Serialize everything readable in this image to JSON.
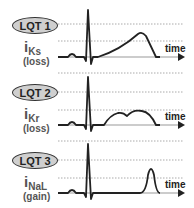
{
  "panels": [
    {
      "label": "LQT 1",
      "current_main": "i",
      "current_sub": "Ks",
      "effect": "(loss)",
      "axis_label": "time"
    },
    {
      "label": "LQT 2",
      "current_main": "i",
      "current_sub": "Kr",
      "effect": "(loss)",
      "axis_label": "time"
    },
    {
      "label": "LQT 3",
      "current_main": "i",
      "current_sub": "NaL",
      "effect": "(gain)",
      "axis_label": "time"
    }
  ],
  "colors": {
    "oval_fill": "#cfcfcf",
    "trace": "#222222",
    "text": "#555555",
    "grid": "#999999"
  }
}
